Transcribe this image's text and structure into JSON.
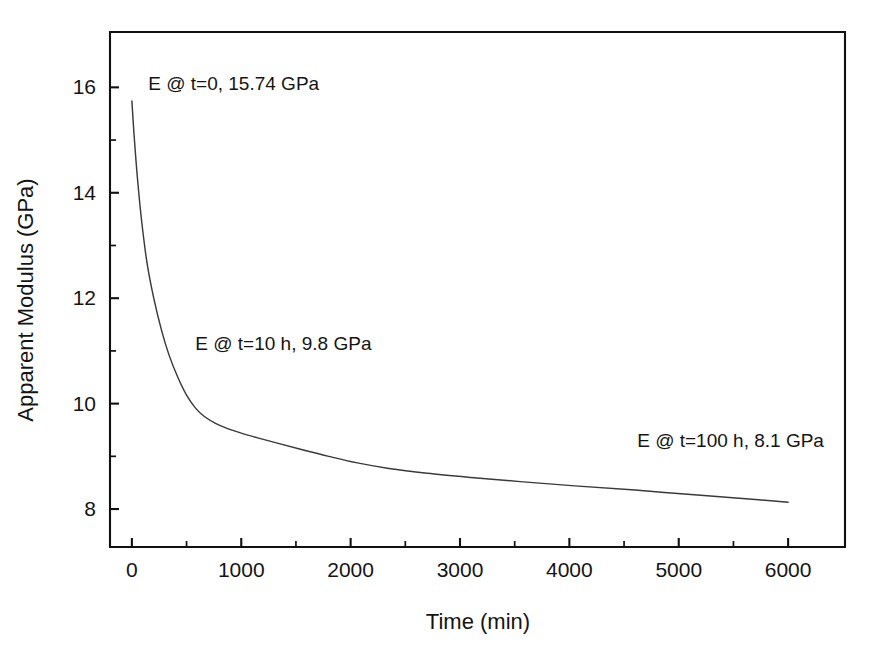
{
  "chart_data": {
    "type": "line",
    "title": "",
    "xlabel": "Time (min)",
    "ylabel": "Apparent Modulus (GPa)",
    "xlim": [
      -200,
      6520
    ],
    "ylim": [
      7.28,
      17.05
    ],
    "xticks": [
      0,
      1000,
      2000,
      3000,
      4000,
      5000,
      6000
    ],
    "xtick_labels": [
      "0",
      "1000",
      "2000",
      "3000",
      "4000",
      "5000",
      "6000"
    ],
    "x_minor_ticks": [
      500,
      1500,
      2500,
      3500,
      4500,
      5500
    ],
    "yticks": [
      8,
      10,
      12,
      14,
      16
    ],
    "ytick_labels": [
      "8",
      "10",
      "12",
      "14",
      "16"
    ],
    "y_minor_ticks": [
      9,
      11,
      13,
      15
    ],
    "grid": false,
    "legend": "none",
    "series": [
      {
        "name": "Apparent Modulus",
        "x": [
          0,
          20,
          50,
          90,
          140,
          200,
          270,
          340,
          420,
          500,
          580,
          660,
          760,
          870,
          1000,
          1150,
          1330,
          1550,
          1800,
          2050,
          2350,
          2700,
          3100,
          3550,
          4050,
          4600,
          5200,
          5700,
          6000
        ],
        "y": [
          15.74,
          15.1,
          14.3,
          13.45,
          12.65,
          12.0,
          11.4,
          10.92,
          10.5,
          10.16,
          9.92,
          9.76,
          9.63,
          9.53,
          9.44,
          9.35,
          9.25,
          9.13,
          9.0,
          8.88,
          8.77,
          8.68,
          8.6,
          8.52,
          8.44,
          8.36,
          8.26,
          8.18,
          8.13
        ]
      }
    ],
    "annotations": [
      {
        "text": "E @ t=0, 15.74 GPa",
        "x": 150,
        "y": 15.95,
        "value": 15.74,
        "at_time_min": 0
      },
      {
        "text": "E @ t=10 h, 9.8 GPa",
        "x": 580,
        "y": 11.02,
        "value": 9.8,
        "at_time_min": 600
      },
      {
        "text": "E @ t=100 h, 8.1 GPa",
        "x": 4620,
        "y": 9.18,
        "value": 8.1,
        "at_time_min": 6000
      }
    ],
    "colors": {
      "curve": "#3a3a3a",
      "axis": "#111111",
      "text": "#141414",
      "background": "#ffffff"
    }
  }
}
